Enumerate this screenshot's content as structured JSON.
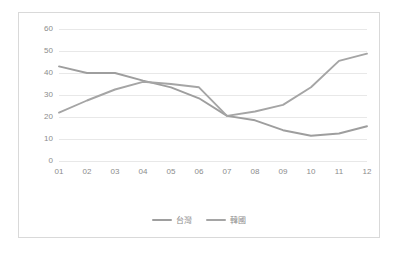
{
  "chart_data": {
    "type": "line",
    "title": "",
    "xlabel": "",
    "ylabel": "",
    "categories": [
      "01",
      "02",
      "03",
      "04",
      "05",
      "06",
      "07",
      "08",
      "09",
      "10",
      "11",
      "12"
    ],
    "ylim": [
      0,
      60
    ],
    "yticks": [
      0,
      10,
      20,
      30,
      40,
      50,
      60
    ],
    "grid": true,
    "legend_position": "bottom",
    "series": [
      {
        "name": "台灣",
        "color": "#9e9e9e",
        "values": [
          43.0,
          40.0,
          40.0,
          36.5,
          33.5,
          28.5,
          20.5,
          18.5,
          14.0,
          11.5,
          12.5,
          15.8
        ]
      },
      {
        "name": "韓國",
        "color": "#a5a5a5",
        "values": [
          22.0,
          27.5,
          32.5,
          36.0,
          35.0,
          33.5,
          20.5,
          22.5,
          25.5,
          33.5,
          45.5,
          48.8
        ]
      }
    ]
  },
  "legend": {
    "entries": [
      {
        "label": "台灣"
      },
      {
        "label": "韓國"
      }
    ]
  },
  "axes": {
    "y_tick_labels": [
      "60",
      "50",
      "40",
      "30",
      "20",
      "10",
      "0"
    ],
    "x_tick_labels": [
      "01",
      "02",
      "03",
      "04",
      "05",
      "06",
      "07",
      "08",
      "09",
      "10",
      "11",
      "12"
    ]
  },
  "colors": {
    "border": "#d9d9d9",
    "gridline": "#e8e8e8",
    "tick_text": "#8c8c8c",
    "series_1": "#9e9e9e",
    "series_2": "#a5a5a5"
  }
}
